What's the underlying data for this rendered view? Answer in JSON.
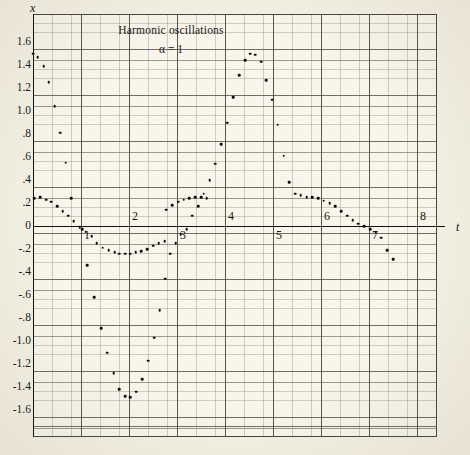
{
  "figure": {
    "title": "Harmonic oscillations",
    "subtitle": "α = 1",
    "x_axis_name": "t",
    "y_axis_name": "x",
    "background_color": "#f3f0e4",
    "plot_background_color": "#f7f5ec",
    "point_color": "#0f0d08",
    "grid_color": "#5f5a4e",
    "axis_color": "#15120c"
  },
  "chart_data": {
    "type": "scatter",
    "title": "Harmonic oscillations",
    "subtitle": "α = 1",
    "xlabel": "t",
    "ylabel": "x",
    "xlim": [
      0,
      8.4
    ],
    "ylim": [
      -1.72,
      1.75
    ],
    "grid": true,
    "legend": null,
    "x_ticks": [
      1,
      2,
      3,
      4,
      5,
      6,
      7,
      8
    ],
    "x_tick_labels": [
      "1",
      "2",
      "3",
      "4",
      "5",
      "6",
      "7",
      "8"
    ],
    "y_ticks": [
      1.6,
      1.4,
      1.2,
      1.0,
      0.8,
      0.6,
      0.4,
      0.2,
      0,
      -0.2,
      -0.4,
      -0.6,
      -0.8,
      -1.0,
      -1.2,
      -1.4,
      -1.6
    ],
    "y_tick_labels": [
      "1.6",
      "1.4",
      "1.2",
      "1.0",
      ".8",
      ".6",
      ".4",
      ".2",
      "0",
      "-.2",
      "-.4",
      "-.6",
      "-.8",
      "-1.0",
      "-1.2",
      "-1.4",
      "-1.6"
    ],
    "series": [
      {
        "name": "x(t)",
        "marker": "dot",
        "points": [
          [
            0.0,
            1.5
          ],
          [
            0.1,
            1.47
          ],
          [
            0.22,
            1.39
          ],
          [
            0.33,
            1.25
          ],
          [
            0.45,
            1.04
          ],
          [
            0.57,
            0.81
          ],
          [
            0.68,
            0.55
          ],
          [
            0.8,
            0.24
          ],
          [
            0.03,
            0.24
          ],
          [
            0.15,
            0.25
          ],
          [
            0.27,
            0.23
          ],
          [
            0.38,
            0.21
          ],
          [
            0.5,
            0.17
          ],
          [
            0.62,
            0.13
          ],
          [
            0.73,
            0.09
          ],
          [
            0.85,
            0.04
          ],
          [
            0.97,
            -0.01
          ],
          [
            1.02,
            -0.03
          ],
          [
            1.1,
            -0.05
          ],
          [
            1.22,
            -0.09
          ],
          [
            1.33,
            -0.15
          ],
          [
            1.45,
            -0.19
          ],
          [
            1.58,
            -0.21
          ],
          [
            1.7,
            -0.23
          ],
          [
            1.8,
            -0.24
          ],
          [
            1.92,
            -0.24
          ],
          [
            2.02,
            -0.24
          ],
          [
            2.14,
            -0.23
          ],
          [
            2.26,
            -0.22
          ],
          [
            2.38,
            -0.2
          ],
          [
            2.5,
            -0.17
          ],
          [
            2.62,
            -0.15
          ],
          [
            2.74,
            -0.13
          ],
          [
            1.13,
            -0.34
          ],
          [
            1.28,
            -0.62
          ],
          [
            1.42,
            -0.89
          ],
          [
            1.55,
            -1.1
          ],
          [
            1.68,
            -1.28
          ],
          [
            1.8,
            -1.42
          ],
          [
            1.92,
            -1.48
          ],
          [
            2.03,
            -1.49
          ],
          [
            2.15,
            -1.44
          ],
          [
            2.27,
            -1.33
          ],
          [
            2.4,
            -1.17
          ],
          [
            2.52,
            -0.97
          ],
          [
            2.64,
            -0.73
          ],
          [
            2.76,
            -0.46
          ],
          [
            2.86,
            -0.24
          ],
          [
            2.97,
            -0.15
          ],
          [
            3.08,
            -0.07
          ],
          [
            3.2,
            -0.03
          ],
          [
            3.32,
            0.09
          ],
          [
            3.44,
            0.17
          ],
          [
            3.56,
            0.28
          ],
          [
            3.68,
            0.4
          ],
          [
            3.8,
            0.54
          ],
          [
            3.92,
            0.71
          ],
          [
            4.05,
            0.9
          ],
          [
            4.17,
            1.12
          ],
          [
            4.3,
            1.31
          ],
          [
            4.42,
            1.44
          ],
          [
            4.52,
            1.5
          ],
          [
            4.63,
            1.49
          ],
          [
            4.75,
            1.43
          ],
          [
            4.86,
            1.27
          ],
          [
            4.98,
            1.1
          ],
          [
            5.1,
            0.88
          ],
          [
            5.22,
            0.61
          ],
          [
            5.34,
            0.38
          ],
          [
            5.46,
            0.28
          ],
          [
            5.58,
            0.27
          ],
          [
            5.7,
            0.25
          ],
          [
            5.82,
            0.25
          ],
          [
            5.94,
            0.24
          ],
          [
            6.06,
            0.22
          ],
          [
            6.18,
            0.2
          ],
          [
            6.3,
            0.17
          ],
          [
            6.42,
            0.13
          ],
          [
            6.54,
            0.09
          ],
          [
            6.66,
            0.05
          ],
          [
            6.78,
            0.02
          ],
          [
            6.9,
            0.0
          ],
          [
            7.02,
            -0.03
          ],
          [
            7.14,
            -0.06
          ],
          [
            7.26,
            -0.1
          ],
          [
            7.38,
            -0.21
          ],
          [
            7.5,
            -0.29
          ],
          [
            3.02,
            0.21
          ],
          [
            3.14,
            0.23
          ],
          [
            3.26,
            0.24
          ],
          [
            3.38,
            0.25
          ],
          [
            3.5,
            0.25
          ],
          [
            3.62,
            0.24
          ],
          [
            2.9,
            0.18
          ],
          [
            2.78,
            0.14
          ]
        ]
      }
    ]
  }
}
